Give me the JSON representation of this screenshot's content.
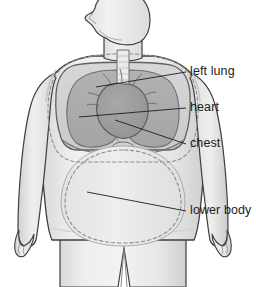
{
  "figure": {
    "background_color": "#ffffff",
    "view": "front view of upper body, head in left profile",
    "labels": [
      {
        "id": "left-lung",
        "text": "left lung",
        "text_x": 190,
        "text_y": 72,
        "leader_from_x": 96,
        "leader_from_y": 87,
        "leader_to_x": 186,
        "leader_to_y": 72,
        "target": "left lung (viewer's right lobe region)"
      },
      {
        "id": "heart",
        "text": "heart",
        "text_x": 190,
        "text_y": 108,
        "leader_from_x": 79,
        "leader_from_y": 117,
        "leader_to_x": 186,
        "leader_to_y": 108,
        "target": "heart"
      },
      {
        "id": "chest",
        "text": "chest",
        "text_x": 190,
        "text_y": 144,
        "leader_from_x": 115,
        "leader_from_y": 120,
        "leader_to_x": 186,
        "leader_to_y": 144,
        "target": "chest cavity dashed boundary"
      },
      {
        "id": "lower-body",
        "text": "lower body",
        "text_x": 190,
        "text_y": 211,
        "leader_from_x": 87,
        "leader_from_y": 192,
        "leader_to_x": 186,
        "leader_to_y": 211,
        "target": "lower body dashed oval"
      }
    ],
    "colors": {
      "body_fill": "#ececed",
      "body_fill_shade": "#dcdcdd",
      "body_outline": "#3f3f3f",
      "chest_cavity_fill": "#d2d3d4",
      "lung_fill": "#a9abac",
      "lung_outline": "#6d6f70",
      "heart_fill": "#9a9c9d",
      "heart_outline": "#5c5e5f",
      "trachea_fill": "#e8e8e9",
      "dashed_stroke": "#8e8e8e",
      "label_text": "#1c1c1c",
      "leader_line": "#1c1c1c"
    },
    "parts": [
      "head",
      "neck",
      "shoulders",
      "left arm",
      "right arm",
      "hands",
      "torso",
      "legs",
      "left lung",
      "right lung",
      "heart",
      "trachea",
      "chest cavity outline",
      "lower body outline"
    ]
  }
}
